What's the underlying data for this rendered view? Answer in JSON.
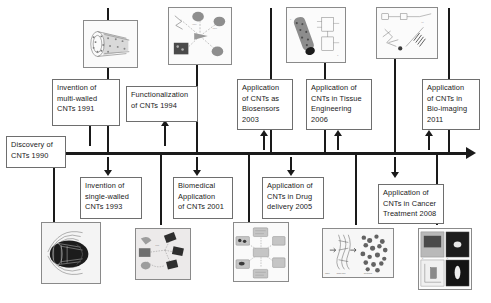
{
  "figure": {
    "kind": "history-timeline",
    "axis": {
      "direction": "left-to-right",
      "arrowhead": "right",
      "color": "#1a1a1a"
    }
  },
  "start_label": {
    "text": "Discovery of\nCNTs 1990",
    "year": "1990",
    "position": "axis-start"
  },
  "milestones": [
    {
      "id": "multi-walled-1991",
      "text": "Invention of\nmulti-walled\nCNTs 1991",
      "year": "1991",
      "side": "above",
      "thumbnail": "multi-walled-nanotube-illustration"
    },
    {
      "id": "single-walled-1993",
      "text": "Invention of\nsingle-walled\nCNTs 1993",
      "year": "1993",
      "side": "below",
      "thumbnail": "single-walled-nanotube-illustration"
    },
    {
      "id": "functionalization-1994",
      "text": "Functionalization\nof CNTs 1994",
      "year": "1994",
      "side": "above",
      "thumbnail": "functionalization-schematic"
    },
    {
      "id": "biomedical-2001",
      "text": "Biomedical\nApplication\nof CNTs 2001",
      "year": "2001",
      "side": "below",
      "thumbnail": "biomedical-application-schematic"
    },
    {
      "id": "biosensors-2003",
      "text": "Application\nof CNTs as\nBiosensors\n2003",
      "year": "2003",
      "side": "above",
      "thumbnail": "biosensor-array-schematic"
    },
    {
      "id": "drug-delivery-2005",
      "text": "Application of\nCNTs in Drug\ndelivery 2005",
      "year": "2005",
      "side": "below",
      "thumbnail": "drug-delivery-cycle-schematic"
    },
    {
      "id": "tissue-engineering-2006",
      "text": "Application of\nCNTs in Tissue\nEngineering\n2006",
      "year": "2006",
      "side": "above",
      "thumbnail": "tissue-engineering-micrograph"
    },
    {
      "id": "cancer-treatment-2008",
      "text": "Application of\nCNTs in Cancer\nTreatment  2008",
      "year": "2008",
      "side": "below",
      "thumbnail": "scaffold-formation-diagram"
    },
    {
      "id": "bio-imaging-2011",
      "text": "Application\nof CNTs in\nBio-imaging\n2011",
      "year": "2011",
      "side": "above",
      "thumbnail": "cancer-therapy-schematic"
    },
    {
      "id": "bio-imaging-panel",
      "text": "",
      "year": "2011",
      "side": "below",
      "thumbnail": "bio-imaging-panel-micrographs"
    }
  ],
  "thumbnails": {
    "top": [
      {
        "id": "multi-walled-nanotube-illustration",
        "caption": ""
      },
      {
        "id": "functionalization-schematic",
        "caption": ""
      },
      {
        "id": "tissue-engineering-micrograph",
        "caption": ""
      },
      {
        "id": "cancer-therapy-schematic",
        "caption": ""
      }
    ],
    "bottom": [
      {
        "id": "single-walled-nanotube-illustration",
        "caption": ""
      },
      {
        "id": "biomedical-application-schematic",
        "caption": ""
      },
      {
        "id": "drug-delivery-cycle-schematic",
        "caption": ""
      },
      {
        "id": "scaffold-formation-diagram",
        "caption": ""
      },
      {
        "id": "bio-imaging-panel-micrographs",
        "caption": ""
      }
    ]
  },
  "colors": {
    "line": "#1a1a1a",
    "box_border": "#6e6e6e",
    "thumb_border": "#8a8a8a",
    "background": "#ffffff",
    "text": "#1a1a1a"
  }
}
